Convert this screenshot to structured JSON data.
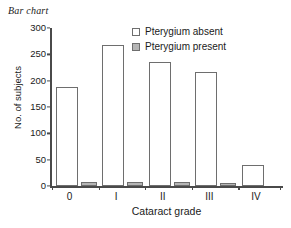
{
  "chart_data": {
    "type": "bar",
    "title": "Bar chart",
    "xlabel": "Cataract grade",
    "ylabel": "No. of subjects",
    "categories": [
      "0",
      "I",
      "II",
      "III",
      "IV"
    ],
    "series": [
      {
        "name": "Pterygium absent",
        "color": "#ffffff",
        "values": [
          188,
          268,
          235,
          216,
          39
        ]
      },
      {
        "name": "Pterygium present",
        "color": "#b5b5b5",
        "values": [
          8,
          8,
          8,
          6,
          0
        ]
      }
    ],
    "ylim": [
      0,
      300
    ],
    "yticks": [
      0,
      50,
      100,
      150,
      200,
      250,
      300
    ],
    "grid": false,
    "legend_position": "top-right"
  },
  "legend": {
    "items": [
      {
        "label": "Pterygium absent",
        "swatch": "white"
      },
      {
        "label": "Pterygium present",
        "swatch": "gray"
      }
    ]
  },
  "colors": {
    "axis": "#4a4a4a",
    "bar_outline": "#6e6e6e",
    "absent_fill": "#ffffff",
    "present_fill": "#b5b5b5",
    "background": "#ffffff"
  }
}
